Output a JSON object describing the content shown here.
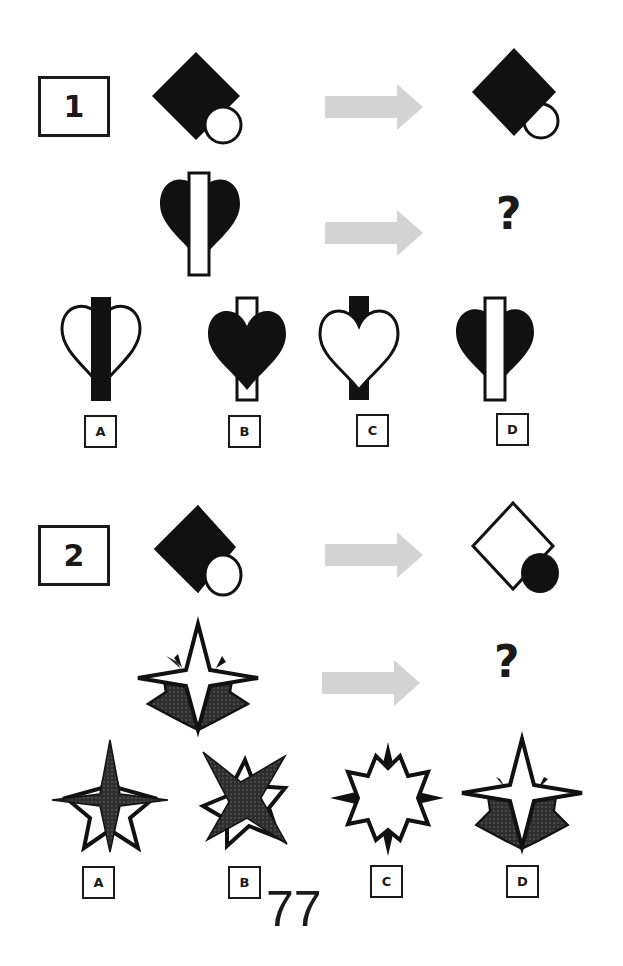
{
  "puzzles": [
    {
      "number": "1",
      "example_rule": "black diamond with white circle overlapping lower-right corner -> black diamond in front, circle behind (only outline of lower half visible)",
      "question_figure": "black heart with white vertical bar in front",
      "question_mark": "?",
      "options": [
        {
          "label": "A",
          "description": "white outline heart, black bar in front"
        },
        {
          "label": "B",
          "description": "black heart in front of white bar"
        },
        {
          "label": "C",
          "description": "white heart in front of black bar"
        },
        {
          "label": "D",
          "description": "black heart, white bar in front"
        }
      ]
    },
    {
      "number": "2",
      "example_rule": "black diamond with white circle -> white outline diamond with black circle",
      "question_figure": "white four-point star in front of dotted dark five-point star",
      "question_mark": "?",
      "options": [
        {
          "label": "A",
          "description": "dotted four-point star in front of white five-point star"
        },
        {
          "label": "B",
          "description": "dotted X-star in front of white rotated star"
        },
        {
          "label": "C",
          "description": "white eight-point star with dark points"
        },
        {
          "label": "D",
          "description": "white four-point star in front of dotted star"
        }
      ]
    }
  ],
  "page_number": "77",
  "colors": {
    "ink": "#111111",
    "arrow": "#d3d3d3",
    "dotted_fill": "#3a3a3a"
  }
}
